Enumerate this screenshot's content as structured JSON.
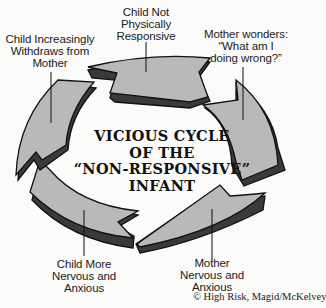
{
  "diagram": {
    "title_lines": [
      "VICIOUS CYCLE",
      "OF THE",
      "“NON-RESPONSIVE”",
      "INFANT"
    ],
    "top_cut_text": "",
    "steps": [
      {
        "id": "step-1",
        "lines": [
          "Child Not",
          "Physically",
          "Responsive"
        ]
      },
      {
        "id": "step-2",
        "lines": [
          "Mother wonders:",
          "“What am I",
          "doing wrong?”"
        ]
      },
      {
        "id": "step-3",
        "lines": [
          "Mother",
          "Nervous and",
          "Anxious"
        ]
      },
      {
        "id": "step-4",
        "lines": [
          "Child More",
          "Nervous and",
          "Anxious"
        ]
      },
      {
        "id": "step-5",
        "lines": [
          "Child Increasingly",
          "Withdraws from",
          "Mother"
        ]
      }
    ],
    "credit": "© High Risk, Magid/McKelvey",
    "colors": {
      "arrow_fill": "#b9b9b9",
      "arrow_side": "#3a3a3a",
      "stroke": "#111111",
      "background": "#fbfbfa"
    }
  }
}
